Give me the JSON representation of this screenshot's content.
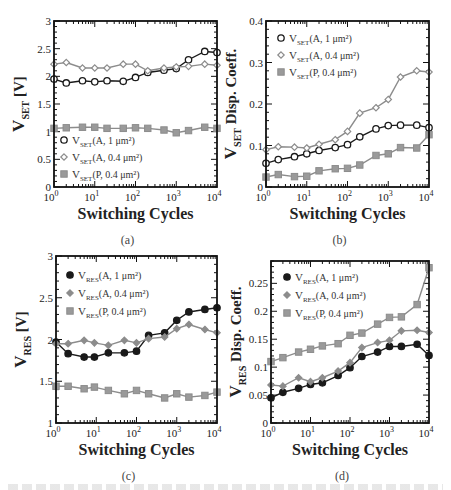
{
  "figure": {
    "background": "#ffffff",
    "colors": {
      "black_series": "#1a1a1a",
      "gray_series": "#8c8c8c",
      "frame": "#111111"
    }
  },
  "chart_data": [
    {
      "id": "a",
      "panel_label": "(a)",
      "type": "line",
      "xscale": "log",
      "x": [
        1,
        2,
        5,
        10,
        20,
        50,
        100,
        200,
        500,
        1000,
        2000,
        5000,
        10000
      ],
      "xlim": [
        1,
        10000
      ],
      "xticks": [
        1,
        10,
        100,
        1000,
        10000
      ],
      "xtick_labels": [
        "10^0",
        "10^1",
        "10^2",
        "10^3",
        "10^4"
      ],
      "xlabel": "Switching Cycles",
      "ylabel_main": "V",
      "ylabel_sub": "SET",
      "ylabel_rest": " [V]",
      "ylim": [
        0,
        3
      ],
      "yticks": [
        0,
        0.5,
        1,
        1.5,
        2,
        2.5,
        3
      ],
      "ytick_labels": [
        "0",
        "0.5",
        "1",
        "1.5",
        "2",
        "2.5",
        "3"
      ],
      "frame": {
        "x": 54,
        "y": 21,
        "w": 163,
        "h": 166
      },
      "legend": {
        "x": 60,
        "y": 140,
        "dy": 17
      },
      "series": [
        {
          "name": "V_SET(A, 1 μm²)",
          "label_main": "V",
          "label_sub": "SET",
          "label_rest": "(A, 1 μm²)",
          "marker": "circle-open",
          "color": "#1a1a1a",
          "values": [
            1.95,
            1.88,
            1.92,
            1.9,
            1.92,
            1.91,
            1.98,
            2.07,
            2.11,
            2.14,
            2.3,
            2.45,
            2.43
          ]
        },
        {
          "name": "V_SET(A, 0.4 μm²)",
          "label_main": "V",
          "label_sub": "SET",
          "label_rest": "(A, 0.4 μm²)",
          "marker": "diamond-open",
          "color": "#8c8c8c",
          "values": [
            2.22,
            2.25,
            2.15,
            2.15,
            2.15,
            2.22,
            2.22,
            2.1,
            2.15,
            2.17,
            2.18,
            2.22,
            2.2
          ]
        },
        {
          "name": "V_SET(P, 0.4 μm²)",
          "label_main": "V",
          "label_sub": "SET",
          "label_rest": "(P, 0.4 μm²)",
          "marker": "square-filled",
          "color": "#8c8c8c",
          "values": [
            1.06,
            1.07,
            1.08,
            1.08,
            1.06,
            1.06,
            1.07,
            1.06,
            1.03,
            0.98,
            1.02,
            1.08,
            1.06
          ]
        }
      ]
    },
    {
      "id": "b",
      "panel_label": "(b)",
      "type": "line",
      "xscale": "log",
      "x": [
        1,
        2,
        5,
        10,
        20,
        50,
        100,
        200,
        500,
        1000,
        2000,
        5000,
        10000
      ],
      "xlim": [
        1,
        10000
      ],
      "xticks": [
        1,
        10,
        100,
        1000,
        10000
      ],
      "xtick_labels": [
        "10^0",
        "10^1",
        "10^2",
        "10^3",
        "10^4"
      ],
      "xlabel": "Switching Cycles",
      "ylabel_main": "V",
      "ylabel_sub": "SET",
      "ylabel_rest": " Disp. Coeff.",
      "ylim": [
        0,
        0.4
      ],
      "yticks": [
        0,
        0.1,
        0.2,
        0.3,
        0.4
      ],
      "ytick_labels": [
        "0",
        "0.1",
        "0.2",
        "0.3",
        "0.4"
      ],
      "frame": {
        "x": 266,
        "y": 21,
        "w": 163,
        "h": 166
      },
      "legend": {
        "x": 277,
        "y": 38,
        "dy": 17
      },
      "series": [
        {
          "name": "V_SET(A, 1 μm²)",
          "label_main": "V",
          "label_sub": "SET",
          "label_rest": "(A, 1 μm²)",
          "marker": "circle-open",
          "color": "#1a1a1a",
          "values": [
            0.057,
            0.066,
            0.073,
            0.08,
            0.088,
            0.095,
            0.102,
            0.121,
            0.14,
            0.148,
            0.149,
            0.149,
            0.143
          ]
        },
        {
          "name": "V_SET(A, 0.4 μm²)",
          "label_main": "V",
          "label_sub": "SET",
          "label_rest": "(A, 0.4 μm²)",
          "marker": "diamond-open",
          "color": "#8c8c8c",
          "values": [
            0.09,
            0.097,
            0.096,
            0.094,
            0.103,
            0.114,
            0.134,
            0.178,
            0.191,
            0.211,
            0.265,
            0.28,
            0.277
          ]
        },
        {
          "name": "V_SET(P, 0.4 μm²)",
          "label_main": "V",
          "label_sub": "SET",
          "label_rest": "(P, 0.4 μm²)",
          "marker": "square-filled",
          "color": "#8c8c8c",
          "values": [
            0.024,
            0.03,
            0.025,
            0.026,
            0.039,
            0.044,
            0.045,
            0.053,
            0.076,
            0.08,
            0.095,
            0.094,
            0.126
          ]
        }
      ]
    },
    {
      "id": "c",
      "panel_label": "(c)",
      "type": "line",
      "xscale": "log",
      "x": [
        1,
        2,
        5,
        9,
        20,
        50,
        100,
        200,
        500,
        1000,
        2000,
        5000,
        10000
      ],
      "xlim": [
        1,
        10000
      ],
      "xticks": [
        1,
        10,
        100,
        1000,
        10000
      ],
      "xtick_labels": [
        "10^0",
        "10^1",
        "10^2",
        "10^3",
        "10^4"
      ],
      "xlabel": "Switching Cycles",
      "ylabel_main": "V",
      "ylabel_sub": "RES",
      "ylabel_rest": " [V]",
      "ylim": [
        1,
        3
      ],
      "yticks": [
        1,
        1.5,
        2,
        2.5,
        3
      ],
      "ytick_labels": [
        "1",
        "1.5",
        "2",
        "2.5",
        "3"
      ],
      "frame": {
        "x": 56,
        "y": 256,
        "w": 161,
        "h": 167
      },
      "legend": {
        "x": 66,
        "y": 275,
        "dy": 18
      },
      "series": [
        {
          "name": "V_RES(A, 1 μm²)",
          "label_main": "V",
          "label_sub": "RES",
          "label_rest": "(A, 1 μm²)",
          "marker": "circle-filled",
          "color": "#1a1a1a",
          "values": [
            1.97,
            1.83,
            1.79,
            1.79,
            1.84,
            1.84,
            1.86,
            2.05,
            2.08,
            2.23,
            2.33,
            2.36,
            2.38
          ]
        },
        {
          "name": "V_RES(A, 0.4 μm²)",
          "label_main": "V",
          "label_sub": "RES",
          "label_rest": "(A, 0.4 μm²)",
          "marker": "diamond-filled",
          "color": "#8c8c8c",
          "values": [
            1.95,
            1.95,
            1.99,
            1.96,
            1.93,
            1.99,
            1.96,
            2.01,
            2.03,
            2.13,
            2.18,
            2.12,
            2.08
          ]
        },
        {
          "name": "V_RES(P, 0.4 μm²)",
          "label_main": "V",
          "label_sub": "RES",
          "label_rest": "(P, 0.4 μm²)",
          "marker": "square-filled",
          "color": "#8c8c8c",
          "values": [
            1.44,
            1.44,
            1.41,
            1.43,
            1.39,
            1.35,
            1.39,
            1.35,
            1.3,
            1.35,
            1.31,
            1.33,
            1.37
          ]
        }
      ]
    },
    {
      "id": "d",
      "panel_label": "(d)",
      "type": "line",
      "xscale": "log",
      "x": [
        1,
        2,
        5,
        10,
        20,
        50,
        100,
        200,
        500,
        1000,
        2000,
        5000,
        10000
      ],
      "xlim": [
        1,
        10000
      ],
      "xticks": [
        1,
        10,
        100,
        1000,
        10000
      ],
      "xtick_labels": [
        "10^0",
        "10^1",
        "10^2",
        "10^3",
        "10^4"
      ],
      "xlabel": "Switching Cycles",
      "ylabel_main": "V",
      "ylabel_sub": "RES",
      "ylabel_rest": " Disp. Coeff.",
      "ylim": [
        0,
        0.29
      ],
      "yticks": [
        0,
        0.05,
        0.1,
        0.15,
        0.2,
        0.25
      ],
      "ytick_labels": [
        "0",
        "0.05",
        "0.1",
        "0.15",
        "0.2",
        "0.25"
      ],
      "frame": {
        "x": 271,
        "y": 261,
        "w": 158,
        "h": 162
      },
      "legend": {
        "x": 283,
        "y": 277,
        "dy": 18
      },
      "series": [
        {
          "name": "V_RES(A, 1 μm²)",
          "label_main": "V",
          "label_sub": "RES",
          "label_rest": "(A, 1 μm²)",
          "marker": "circle-filled",
          "color": "#1a1a1a",
          "values": [
            0.045,
            0.055,
            0.062,
            0.069,
            0.072,
            0.085,
            0.099,
            0.119,
            0.127,
            0.137,
            0.137,
            0.141,
            0.121
          ]
        },
        {
          "name": "V_RES(A, 0.4 μm²)",
          "label_main": "V",
          "label_sub": "RES",
          "label_rest": "(A, 0.4 μm²)",
          "marker": "diamond-filled",
          "color": "#8c8c8c",
          "values": [
            0.068,
            0.066,
            0.081,
            0.074,
            0.081,
            0.093,
            0.108,
            0.135,
            0.144,
            0.148,
            0.165,
            0.166,
            0.162
          ]
        },
        {
          "name": "V_RES(P, 0.4 μm²)",
          "label_main": "V",
          "label_sub": "RES",
          "label_rest": "(P, 0.4 μm²)",
          "marker": "square-filled",
          "color": "#8c8c8c",
          "values": [
            0.11,
            0.117,
            0.127,
            0.132,
            0.138,
            0.142,
            0.157,
            0.161,
            0.177,
            0.189,
            0.19,
            0.212,
            0.278
          ]
        }
      ]
    }
  ]
}
